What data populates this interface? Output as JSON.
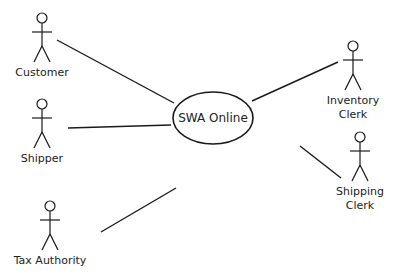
{
  "diagram": {
    "type": "use-case",
    "use_case": {
      "label": "SWA Online",
      "cx": 213,
      "cy": 118,
      "rx": 40,
      "ry": 26
    },
    "actors": [
      {
        "id": "customer",
        "label_lines": [
          "Customer"
        ],
        "x": 42,
        "y": 18,
        "link": [
          57,
          40,
          174,
          103
        ]
      },
      {
        "id": "shipper",
        "label_lines": [
          "Shipper"
        ],
        "x": 42,
        "y": 104,
        "link": [
          68,
          128,
          171,
          125
        ]
      },
      {
        "id": "tax-authority",
        "label_lines": [
          "Tax Authority"
        ],
        "x": 50,
        "y": 206,
        "link": [
          101,
          232,
          176,
          188
        ]
      },
      {
        "id": "inventory-clerk",
        "label_lines": [
          "Inventory",
          "Clerk"
        ],
        "x": 353,
        "y": 46,
        "link": [
          338,
          62,
          252,
          101
        ]
      },
      {
        "id": "shipping-clerk",
        "label_lines": [
          "Shipping",
          "Clerk"
        ],
        "x": 360,
        "y": 137,
        "link": [
          300,
          146,
          341,
          178
        ]
      }
    ],
    "stroke_color": "#1a1a1a"
  }
}
